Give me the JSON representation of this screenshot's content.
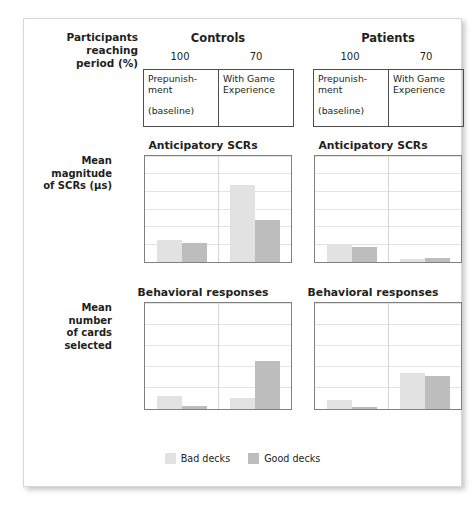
{
  "header": {
    "participants_label": "Participants reaching period (%)",
    "participants_label_lines": [
      "Participants",
      "reaching",
      "period (%)"
    ],
    "groups": [
      {
        "name": "Controls",
        "percents": [
          "100",
          "70"
        ],
        "conditions": [
          {
            "line1": "Prepunish-",
            "line2": "ment",
            "sub": "(baseline)"
          },
          {
            "line1": "With Game",
            "line2": "Experience",
            "sub": ""
          }
        ]
      },
      {
        "name": "Patients",
        "percents": [
          "100",
          "70"
        ],
        "conditions": [
          {
            "line1": "Prepunish-",
            "line2": "ment",
            "sub": "(baseline)"
          },
          {
            "line1": "With Game",
            "line2": "Experience",
            "sub": ""
          }
        ]
      }
    ]
  },
  "legend": {
    "items": [
      {
        "label": "Bad decks",
        "color": "#e2e2e2",
        "key": "bad"
      },
      {
        "label": "Good decks",
        "color": "#bdbdbd",
        "key": "good"
      }
    ]
  },
  "axis_captions": {
    "scr": "Mean magnitude of SCRs (µs)",
    "scr_lines": [
      "Mean",
      "magnitude",
      "of SCRs (µs)"
    ],
    "behavioral": "Mean number of cards selected",
    "behavioral_lines": [
      "Mean",
      "number",
      "of cards",
      "selected"
    ]
  },
  "chart_data": [
    {
      "id": "controls-scr",
      "type": "bar",
      "title": "Anticipatory SCRs",
      "group": "Controls",
      "xlabel": "",
      "ylabel": "Mean magnitude of SCRs (µs)",
      "ylim": [
        0.0,
        1.2
      ],
      "yticks": [
        "0.0",
        "0.2",
        "0.4",
        "0.6",
        "0.8",
        "1.0",
        "1.2"
      ],
      "ytick_values": [
        0.0,
        0.2,
        0.4,
        0.6,
        0.8,
        1.0,
        1.2
      ],
      "grid": true,
      "legend_position": "bottom",
      "categories": [
        "Prepunishment (baseline)",
        "With Game Experience"
      ],
      "series": [
        {
          "name": "Bad decks",
          "color": "#e2e2e2",
          "values": [
            0.25,
            0.87
          ]
        },
        {
          "name": "Good decks",
          "color": "#bdbdbd",
          "values": [
            0.21,
            0.48
          ]
        }
      ]
    },
    {
      "id": "patients-scr",
      "type": "bar",
      "title": "Anticipatory SCRs",
      "group": "Patients",
      "xlabel": "",
      "ylabel": "Mean magnitude of SCRs (µs)",
      "ylim": [
        0.0,
        1.2
      ],
      "yticks": [
        "0.0",
        "0.2",
        "0.4",
        "0.6",
        "0.8",
        "1.0",
        "1.2"
      ],
      "ytick_values": [
        0.0,
        0.2,
        0.4,
        0.6,
        0.8,
        1.0,
        1.2
      ],
      "grid": true,
      "legend_position": "bottom",
      "categories": [
        "Prepunishment (baseline)",
        "With Game Experience"
      ],
      "series": [
        {
          "name": "Bad decks",
          "color": "#e2e2e2",
          "values": [
            0.2,
            0.03
          ]
        },
        {
          "name": "Good decks",
          "color": "#bdbdbd",
          "values": [
            0.17,
            0.04
          ]
        }
      ]
    },
    {
      "id": "controls-behavioral",
      "type": "bar",
      "title": "Behavioral responses",
      "group": "Controls",
      "xlabel": "",
      "ylabel": "Mean number of cards selected",
      "ylim": [
        0,
        25
      ],
      "yticks": [
        "0",
        "5",
        "10",
        "15",
        "20",
        "25"
      ],
      "ytick_values": [
        0,
        5,
        10,
        15,
        20,
        25
      ],
      "grid": true,
      "legend_position": "bottom",
      "categories": [
        "Prepunishment (baseline)",
        "With Game Experience"
      ],
      "series": [
        {
          "name": "Bad decks",
          "color": "#e2e2e2",
          "values": [
            3.0,
            2.6
          ]
        },
        {
          "name": "Good decks",
          "color": "#bdbdbd",
          "values": [
            0.7,
            11.3
          ]
        }
      ]
    },
    {
      "id": "patients-behavioral",
      "type": "bar",
      "title": "Behavioral responses",
      "group": "Patients",
      "xlabel": "",
      "ylabel": "Mean number of cards selected",
      "ylim": [
        0,
        25
      ],
      "yticks": [
        "0",
        "5",
        "10",
        "15",
        "20",
        "25"
      ],
      "ytick_values": [
        0,
        5,
        10,
        15,
        20,
        25
      ],
      "grid": true,
      "legend_position": "bottom",
      "categories": [
        "Prepunishment (baseline)",
        "With Game Experience"
      ],
      "series": [
        {
          "name": "Bad decks",
          "color": "#e2e2e2",
          "values": [
            2.2,
            8.5
          ]
        },
        {
          "name": "Good decks",
          "color": "#bdbdbd",
          "values": [
            0.5,
            7.9
          ]
        }
      ]
    }
  ]
}
